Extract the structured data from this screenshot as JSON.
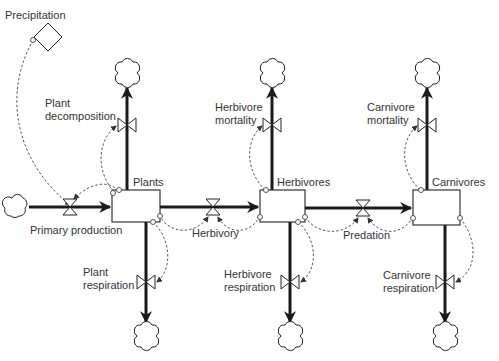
{
  "diagram": {
    "type": "stock-and-flow",
    "colors": {
      "line": "#1a1a1a",
      "text": "#333333",
      "background": "#ffffff"
    },
    "converters": [
      {
        "id": "precipitation",
        "label": "Precipitation",
        "shape": "diamond"
      }
    ],
    "stocks": [
      {
        "id": "plants",
        "label": "Plants"
      },
      {
        "id": "herbivores",
        "label": "Herbivores"
      },
      {
        "id": "carnivores",
        "label": "Carnivores"
      }
    ],
    "flows": {
      "primary_production": {
        "label": "Primary production",
        "from": "cloud",
        "to": "plants"
      },
      "plant_decomposition": {
        "line1": "Plant",
        "line2": "decomposition",
        "from": "plants",
        "to": "cloud"
      },
      "plant_respiration": {
        "line1": "Plant",
        "line2": "respiration",
        "from": "plants",
        "to": "cloud"
      },
      "herbivory": {
        "label": "Herbivory",
        "from": "plants",
        "to": "herbivores"
      },
      "herbivore_mortality": {
        "line1": "Herbivore",
        "line2": "mortality",
        "from": "herbivores",
        "to": "cloud"
      },
      "herbivore_respiration": {
        "line1": "Herbivore",
        "line2": "respiration",
        "from": "herbivores",
        "to": "cloud"
      },
      "predation": {
        "label": "Predation",
        "from": "herbivores",
        "to": "carnivores"
      },
      "carnivore_mortality": {
        "line1": "Carnivore",
        "line2": "mortality",
        "from": "carnivores",
        "to": "cloud"
      },
      "carnivore_respiration": {
        "line1": "Carnivore",
        "line2": "respiration",
        "from": "carnivores",
        "to": "cloud"
      }
    }
  }
}
